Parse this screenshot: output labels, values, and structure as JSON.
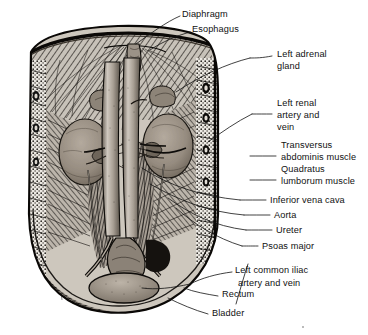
{
  "figure": {
    "style": "black-and-white pen-and-ink engraving",
    "background_color": "#ffffff",
    "ink_color": "#111111",
    "tissue_tint": "#8e867c",
    "kidney_tint": "#9a9086"
  },
  "labels": [
    {
      "id": "diaphragm",
      "text": "Diaphragm",
      "x": 182,
      "y": 17,
      "align": "start"
    },
    {
      "id": "esophagus",
      "text": "Esophagus",
      "x": 192,
      "y": 32,
      "align": "start"
    },
    {
      "id": "left-adrenal",
      "text": "Left adrenal",
      "x": 277,
      "y": 57,
      "align": "start"
    },
    {
      "id": "left-adrenal-2",
      "text": "gland",
      "x": 277,
      "y": 69,
      "align": "start"
    },
    {
      "id": "left-renal",
      "text": "Left renal",
      "x": 277,
      "y": 106,
      "align": "start"
    },
    {
      "id": "left-renal-2",
      "text": "artery and",
      "x": 277,
      "y": 118,
      "align": "start"
    },
    {
      "id": "left-renal-3",
      "text": "vein",
      "x": 277,
      "y": 130,
      "align": "start"
    },
    {
      "id": "transversus",
      "text": "Transversus",
      "x": 281,
      "y": 148,
      "align": "start"
    },
    {
      "id": "transversus-2",
      "text": "abdominis muscle",
      "x": 281,
      "y": 160,
      "align": "start"
    },
    {
      "id": "quadratus",
      "text": "Quadratus",
      "x": 281,
      "y": 172,
      "align": "start"
    },
    {
      "id": "quadratus-2",
      "text": "lumborum muscle",
      "x": 281,
      "y": 184,
      "align": "start"
    },
    {
      "id": "ivc",
      "text": "Inferior vena cava",
      "x": 270,
      "y": 203,
      "align": "start"
    },
    {
      "id": "aorta",
      "text": "Aorta",
      "x": 274,
      "y": 218,
      "align": "start"
    },
    {
      "id": "ureter",
      "text": "Ureter",
      "x": 276,
      "y": 233,
      "align": "start"
    },
    {
      "id": "psoas",
      "text": "Psoas major",
      "x": 262,
      "y": 249,
      "align": "start"
    },
    {
      "id": "left-iliac",
      "text": "Left common iliac",
      "x": 235,
      "y": 273,
      "align": "start"
    },
    {
      "id": "left-iliac-2",
      "text": "artery and vein",
      "x": 238,
      "y": 286,
      "align": "start"
    },
    {
      "id": "rectum",
      "text": "Rectum",
      "x": 222,
      "y": 297,
      "align": "start"
    },
    {
      "id": "bladder",
      "text": "Bladder",
      "x": 212,
      "y": 316,
      "align": "start"
    }
  ],
  "structures": [
    "Diaphragm",
    "Esophagus",
    "Left adrenal gland",
    "Left renal artery and vein",
    "Transversus abdominis muscle",
    "Quadratus lumborum muscle",
    "Inferior vena cava",
    "Aorta",
    "Ureter",
    "Psoas major",
    "Left common iliac artery and vein",
    "Rectum",
    "Bladder"
  ]
}
